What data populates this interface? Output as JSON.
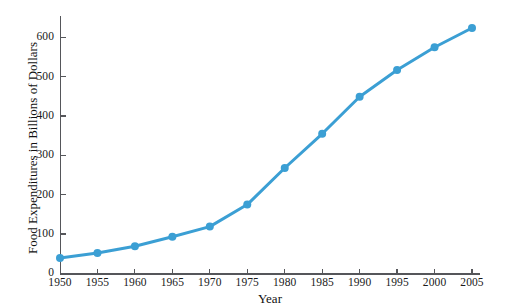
{
  "chart_data": {
    "type": "line",
    "title": "",
    "subtitle": "",
    "xlabel": "Year",
    "ylabel": "Food Expenditures in Billions of Dollars",
    "x": [
      1950,
      1955,
      1960,
      1965,
      1970,
      1975,
      1980,
      1985,
      1990,
      1995,
      2000,
      2005
    ],
    "values": [
      39,
      52,
      69,
      93,
      119,
      175,
      268,
      355,
      449,
      517,
      575,
      624
    ],
    "series": [
      {
        "name": "Food Expenditures",
        "values": [
          39,
          52,
          69,
          93,
          119,
          175,
          268,
          355,
          449,
          517,
          575,
          624
        ]
      }
    ],
    "xlim": [
      1950,
      2007
    ],
    "ylim": [
      0,
      655
    ],
    "xticks": [
      1950,
      1955,
      1960,
      1965,
      1970,
      1975,
      1980,
      1985,
      1990,
      1995,
      2000,
      2005
    ],
    "yticks": [
      0,
      100,
      200,
      300,
      400,
      500,
      600
    ],
    "xtick_labels": [
      "1950",
      "1955",
      "1960",
      "1965",
      "1970",
      "1975",
      "1980",
      "1985",
      "1990",
      "1995",
      "2000",
      "2005"
    ],
    "ytick_labels": [
      "0",
      "100",
      "200",
      "300",
      "400",
      "500",
      "600"
    ],
    "grid": false,
    "legend": null,
    "legend_position": "none",
    "annotations": [],
    "colors": {
      "line": "#3b9fd4",
      "marker": "#3b9fd4",
      "axis": "#55565a",
      "text": "#1a1a1a",
      "background": "#ffffff"
    },
    "line_width": 3,
    "marker_size": 4,
    "marker_shape": "circle"
  }
}
